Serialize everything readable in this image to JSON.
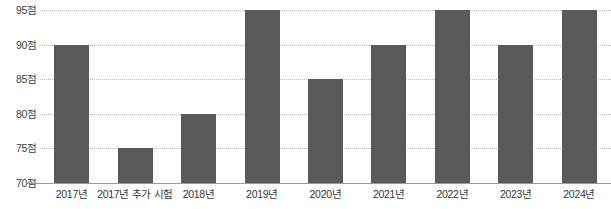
{
  "chart_data": {
    "type": "bar",
    "title": "",
    "subtitle": "",
    "xlabel": "",
    "ylabel": "",
    "categories": [
      "2017년",
      "2017년 추가 시험",
      "2018년",
      "2019년",
      "2020년",
      "2021년",
      "2022년",
      "2023년",
      "2024년"
    ],
    "values": [
      90,
      75,
      80,
      95,
      85,
      90,
      95,
      90,
      95
    ],
    "ylim": [
      70,
      95
    ],
    "yticks": [
      70,
      75,
      80,
      85,
      90,
      95
    ],
    "ytick_labels": [
      "70점",
      "75점",
      "80점",
      "85점",
      "90점",
      "95점"
    ],
    "grid": true,
    "grid_style": "dotted",
    "legend": false,
    "legend_position": "none",
    "bar_color": "#595959",
    "gridline_color": "#b9b9b9",
    "axis_color": "#9a9a9a",
    "background_color": "#ffffff",
    "unit": "점"
  }
}
